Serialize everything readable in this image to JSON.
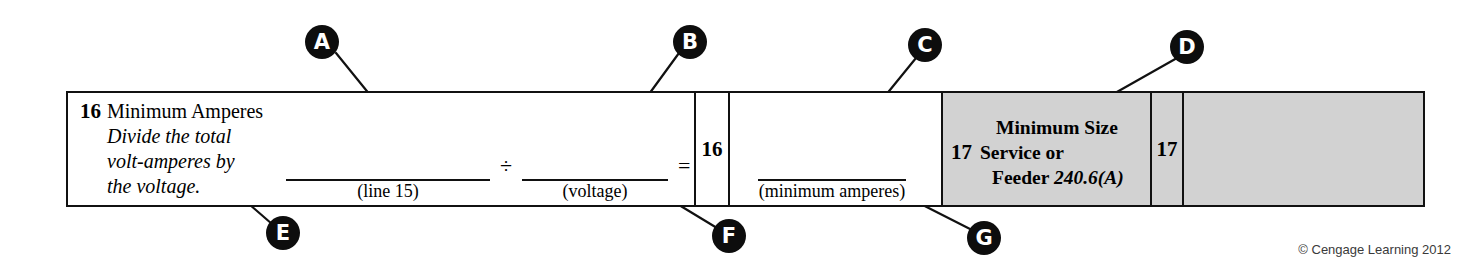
{
  "worksheet": {
    "row16": {
      "line_number": "16",
      "title": "Minimum Amperes",
      "instruction": "Divide the total volt-amperes by the voltage.",
      "instruction_lines": [
        "Divide the total",
        "volt-amperes by",
        "the voltage."
      ],
      "equation": {
        "blank1_caption": "(line 15)",
        "operator_divide": "÷",
        "blank2_caption": "(voltage)",
        "operator_equals": "=",
        "answer_box_number": "16",
        "result_blank_caption": "(minimum amperes)"
      }
    },
    "row17": {
      "line_number": "17",
      "title_lines": [
        "Minimum Size",
        "Service or",
        "Feeder "
      ],
      "code_reference": "240.6(A)",
      "answer_box_number": "17"
    }
  },
  "callouts": [
    {
      "id": "A",
      "label": "A"
    },
    {
      "id": "B",
      "label": "B"
    },
    {
      "id": "C",
      "label": "C"
    },
    {
      "id": "D",
      "label": "D"
    },
    {
      "id": "E",
      "label": "E"
    },
    {
      "id": "F",
      "label": "F"
    },
    {
      "id": "G",
      "label": "G"
    }
  ],
  "credit": "© Cengage Learning 2012",
  "colors": {
    "ink": "#111111",
    "shaded_cell": "#d2d2d2",
    "callout_fill": "#0d0d0d",
    "callout_text": "#ffffff",
    "page": "#ffffff"
  }
}
